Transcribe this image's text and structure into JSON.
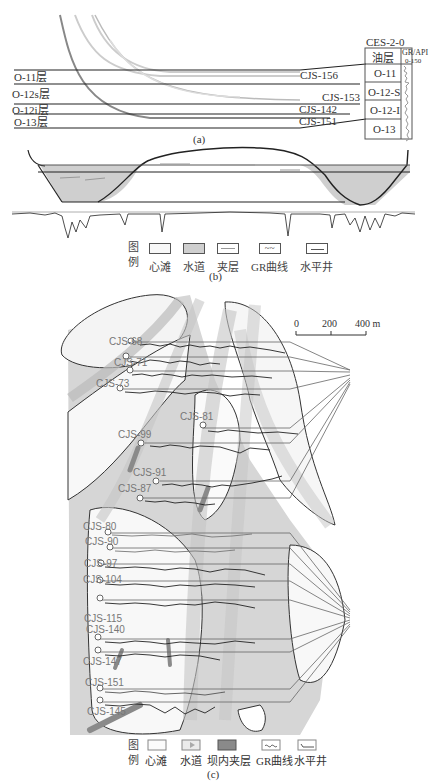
{
  "panel_a": {
    "caption": "(a)",
    "layers": [
      "O-11层",
      "O-12s层",
      "O-12i层",
      "O-13层"
    ],
    "wells": [
      "CJS-156",
      "CJS-153",
      "CJS-142",
      "CJS-151"
    ],
    "reference_well": "CES-2-0",
    "table_header": {
      "layer": "油层",
      "gr": "GR/API",
      "gr_range": "0-150"
    },
    "table_rows": [
      "O-11",
      "O-12-S",
      "O-12-I",
      "O-13"
    ]
  },
  "panel_b": {
    "caption": "(b)",
    "legend": {
      "title_top": "图",
      "title_bottom": "例",
      "items": [
        "心滩",
        "水道",
        "夹层",
        "GR曲线",
        "水平井"
      ]
    }
  },
  "panel_c": {
    "caption": "(c)",
    "scale_bar": {
      "ticks": [
        "0",
        "200",
        "400 m"
      ]
    },
    "wells": [
      "CJS-68",
      "CJS-71",
      "CJS-73",
      "CJS-81",
      "CJS-99",
      "CJS-91",
      "CJS-87",
      "CJS-80",
      "CJS-90",
      "CJS-97",
      "CJS-104",
      "CJS-115",
      "CJS-140",
      "CJS-147",
      "CJS-151",
      "CJS-145"
    ],
    "legend": {
      "title_top": "图",
      "title_bottom": "例",
      "items": [
        "心滩",
        "水道",
        "坝内夹层",
        "GR曲线",
        "水平井"
      ]
    }
  },
  "colors": {
    "channel": "#d4d4d4",
    "bar": "#f4f4f4",
    "interlayer": "#8a8a8a",
    "line": "#222222"
  }
}
